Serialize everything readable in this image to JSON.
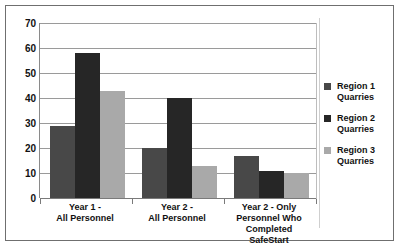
{
  "chart_data": {
    "type": "bar",
    "title": "",
    "xlabel": "",
    "ylabel": "",
    "ylim": [
      0,
      70
    ],
    "ytick_step": 10,
    "yticks": [
      "70",
      "60",
      "50",
      "40",
      "30",
      "20",
      "10",
      "0"
    ],
    "grid": true,
    "legend_position": "right",
    "categories": [
      "Year 1 -\nAll Personnel",
      "Year 2 -\nAll Personnel",
      "Year 2 - Only\nPersonnel Who\nCompleted\nSafeStart"
    ],
    "category_lines": [
      [
        "Year 1 -",
        "All Personnel"
      ],
      [
        "Year 2 -",
        "All Personnel"
      ],
      [
        "Year 2 - Only",
        "Personnel Who",
        "Completed",
        "SafeStart"
      ]
    ],
    "series": [
      {
        "name": "Region 1 Quarries",
        "color": "#484848",
        "values": [
          29,
          20,
          17
        ]
      },
      {
        "name": "Region 2 Quarries",
        "color": "#262626",
        "values": [
          58,
          40,
          11
        ]
      },
      {
        "name": "Region 3 Quarries",
        "color": "#a9a9a9",
        "values": [
          43,
          13,
          10
        ]
      }
    ]
  },
  "legend": {
    "entries": [
      {
        "label_line1": "Region 1",
        "label_line2": "Quarries"
      },
      {
        "label_line1": "Region 2",
        "label_line2": "Quarries"
      },
      {
        "label_line1": "Region 3",
        "label_line2": "Quarries"
      }
    ]
  },
  "axis": {
    "ticks": [
      "70",
      "60",
      "50",
      "40",
      "30",
      "20",
      "10",
      "0"
    ]
  }
}
